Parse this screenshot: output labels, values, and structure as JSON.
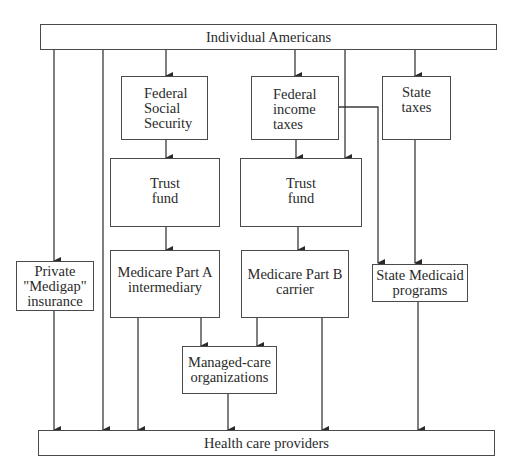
{
  "diagram": {
    "nodes": {
      "individuals": {
        "label": "Individual Americans"
      },
      "fed_ss": {
        "lines": [
          "Federal",
          "Social",
          "Security"
        ]
      },
      "fed_income": {
        "lines": [
          "Federal",
          "income",
          "taxes"
        ]
      },
      "state_taxes": {
        "lines": [
          "State",
          "taxes"
        ]
      },
      "trust_a": {
        "lines": [
          "Trust",
          "fund"
        ]
      },
      "trust_b": {
        "lines": [
          "Trust",
          "fund"
        ]
      },
      "medicare_a": {
        "lines": [
          "Medicare Part A",
          "intermediary"
        ]
      },
      "medicare_b": {
        "lines": [
          "Medicare Part B",
          "carrier"
        ]
      },
      "medigap": {
        "lines": [
          "Private",
          "\"Medigap\"",
          "insurance"
        ]
      },
      "medicaid": {
        "lines": [
          "State Medicaid",
          "programs"
        ]
      },
      "managed_care": {
        "lines": [
          "Managed-care",
          "organizations"
        ]
      },
      "providers": {
        "label": "Health care providers"
      }
    },
    "edges": [
      {
        "from": "Individual Americans",
        "to": "Private \"Medigap\" insurance"
      },
      {
        "from": "Individual Americans",
        "to": "Health care providers"
      },
      {
        "from": "Individual Americans",
        "to": "Federal Social Security"
      },
      {
        "from": "Individual Americans",
        "to": "Federal income taxes"
      },
      {
        "from": "Individual Americans",
        "to": "Trust fund (Part B)"
      },
      {
        "from": "Individual Americans",
        "to": "State taxes"
      },
      {
        "from": "Federal Social Security",
        "to": "Trust fund (Part A)"
      },
      {
        "from": "Federal income taxes",
        "to": "Trust fund (Part B)"
      },
      {
        "from": "Federal income taxes",
        "to": "State Medicaid programs"
      },
      {
        "from": "State taxes",
        "to": "State Medicaid programs"
      },
      {
        "from": "Trust fund (Part A)",
        "to": "Medicare Part A intermediary"
      },
      {
        "from": "Trust fund (Part B)",
        "to": "Medicare Part B carrier"
      },
      {
        "from": "Medicare Part A intermediary",
        "to": "Managed-care organizations"
      },
      {
        "from": "Medicare Part A intermediary",
        "to": "Health care providers"
      },
      {
        "from": "Medicare Part B carrier",
        "to": "Managed-care organizations"
      },
      {
        "from": "Medicare Part B carrier",
        "to": "Health care providers"
      },
      {
        "from": "Private \"Medigap\" insurance",
        "to": "Health care providers"
      },
      {
        "from": "Managed-care organizations",
        "to": "Health care providers"
      },
      {
        "from": "State Medicaid programs",
        "to": "Health care providers"
      }
    ],
    "colors": {
      "line": "#3a3a3a",
      "box_border": "#4a4a4a",
      "text": "#2a2a2a",
      "background": "#ffffff"
    }
  }
}
